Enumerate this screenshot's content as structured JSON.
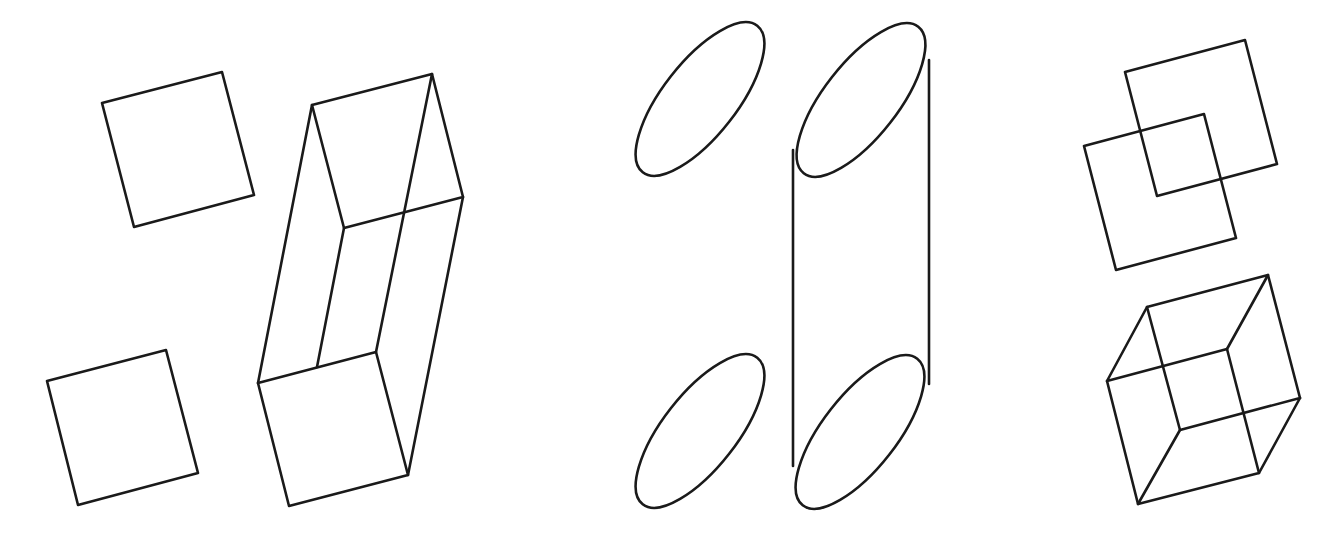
{
  "diagram": {
    "background": "#ffffff",
    "stroke_color": "#1a1a1a",
    "groups": [
      {
        "name": "square-extrusion",
        "shapes": {
          "square_a": [
            [
              102,
              103
            ],
            [
              222,
              72
            ],
            [
              254,
              195
            ],
            [
              134,
              227
            ]
          ],
          "square_b": [
            [
              47,
              381
            ],
            [
              166,
              350
            ],
            [
              198,
              473
            ],
            [
              78,
              505
            ]
          ],
          "prism_top": [
            [
              312,
              105
            ],
            [
              432,
              74
            ],
            [
              463,
              197
            ],
            [
              344,
              228
            ]
          ],
          "prism_bottom": [
            [
              258,
              383
            ],
            [
              376,
              352
            ],
            [
              408,
              475
            ],
            [
              289,
              506
            ]
          ],
          "prism_edges": [
            [
              [
                312,
                105
              ],
              [
                258,
                383
              ]
            ],
            [
              [
                432,
                74
              ],
              [
                376,
                352
              ]
            ],
            [
              [
                463,
                197
              ],
              [
                408,
                475
              ]
            ],
            [
              [
                344,
                228
              ],
              [
                317,
                367
              ]
            ]
          ]
        }
      },
      {
        "name": "ellipse-extrusion",
        "shapes": {
          "ellipse_a": {
            "cx": 700,
            "cy": 99,
            "rx": 93,
            "ry": 37,
            "rotate": -52
          },
          "ellipse_b": {
            "cx": 700,
            "cy": 431,
            "rx": 93,
            "ry": 37,
            "rotate": -52
          },
          "cyl_top": {
            "cx": 861,
            "cy": 100,
            "rx": 93,
            "ry": 37,
            "rotate": -52
          },
          "cyl_bottom": {
            "cx": 860,
            "cy": 432,
            "rx": 93,
            "ry": 37,
            "rotate": -52
          },
          "cyl_edges": [
            [
              [
                793,
                150
              ],
              [
                793,
                466
              ]
            ],
            [
              [
                929,
                60
              ],
              [
                929,
                384
              ]
            ]
          ]
        }
      },
      {
        "name": "overlapping-squares-and-cube",
        "shapes": {
          "square_upper": [
            [
              1125,
              72
            ],
            [
              1245,
              40
            ],
            [
              1277,
              164
            ],
            [
              1157,
              196
            ]
          ],
          "square_lower": [
            [
              1084,
              146
            ],
            [
              1204,
              114
            ],
            [
              1236,
              238
            ],
            [
              1116,
              270
            ]
          ],
          "cube_back": [
            [
              1147,
              307
            ],
            [
              1268,
              275
            ],
            [
              1300,
              398
            ],
            [
              1180,
              430
            ]
          ],
          "cube_front": [
            [
              1107,
              381
            ],
            [
              1227,
              349
            ],
            [
              1259,
              473
            ],
            [
              1138,
              504
            ]
          ],
          "cube_edges": [
            [
              [
                1107,
                381
              ],
              [
                1147,
                307
              ]
            ],
            [
              [
                1227,
                349
              ],
              [
                1268,
                275
              ]
            ],
            [
              [
                1259,
                473
              ],
              [
                1300,
                398
              ]
            ],
            [
              [
                1138,
                504
              ],
              [
                1180,
                430
              ]
            ]
          ]
        }
      }
    ]
  }
}
